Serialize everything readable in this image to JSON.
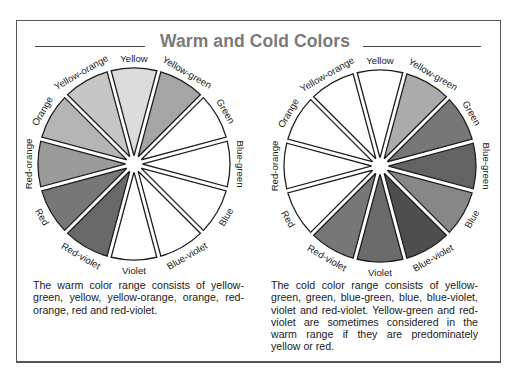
{
  "title": "Warm and Cold Colors",
  "wheels": [
    {
      "id": "warm",
      "center": [
        134,
        164
      ],
      "radius": 98,
      "segments": [
        {
          "label": "Yellow",
          "fill": "#dcdcdc"
        },
        {
          "label": "Yellow-green",
          "fill": "#a5a5a5"
        },
        {
          "label": "Green",
          "fill": "#ffffff"
        },
        {
          "label": "Blue-green",
          "fill": "#ffffff"
        },
        {
          "label": "Blue",
          "fill": "#ffffff"
        },
        {
          "label": "Blue-violet",
          "fill": "#ffffff"
        },
        {
          "label": "Violet",
          "fill": "#ffffff"
        },
        {
          "label": "Red-violet",
          "fill": "#696969"
        },
        {
          "label": "Red",
          "fill": "#777777"
        },
        {
          "label": "Red-orange",
          "fill": "#9a9a9a"
        },
        {
          "label": "Orange",
          "fill": "#b5b5b5"
        },
        {
          "label": "Yellow-orange",
          "fill": "#c6c6c6"
        }
      ],
      "caption": "The warm color range consists of yellow-green, yellow, yellow-orange, orange, red-orange, red and red-violet."
    },
    {
      "id": "cold",
      "center": [
        380,
        166
      ],
      "radius": 98,
      "segments": [
        {
          "label": "Yellow",
          "fill": "#ffffff"
        },
        {
          "label": "Yellow-green",
          "fill": "#ababab"
        },
        {
          "label": "Green",
          "fill": "#777777"
        },
        {
          "label": "Blue-green",
          "fill": "#636363"
        },
        {
          "label": "Blue",
          "fill": "#878787"
        },
        {
          "label": "Blue-violet",
          "fill": "#4e4e4e"
        },
        {
          "label": "Violet",
          "fill": "#6b6b6b"
        },
        {
          "label": "Red-violet",
          "fill": "#777777"
        },
        {
          "label": "Red",
          "fill": "#ffffff"
        },
        {
          "label": "Red-orange",
          "fill": "#ffffff"
        },
        {
          "label": "Orange",
          "fill": "#ffffff"
        },
        {
          "label": "Yellow-orange",
          "fill": "#ffffff"
        }
      ],
      "caption": "The cold color range consists of yellow-green, green, blue-green, blue, blue-violet, violet and red-violet. Yellow-green and red-violet are sometimes considered in the warm range if they are predominately yellow or red."
    }
  ]
}
